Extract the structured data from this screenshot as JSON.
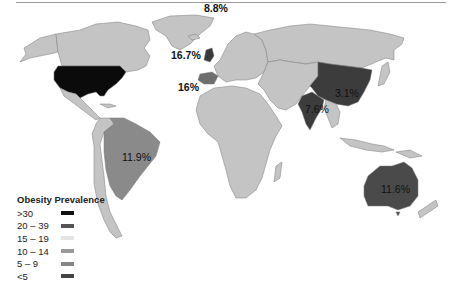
{
  "map": {
    "title": "",
    "colors": {
      "land_default": "#c4c4c4",
      "border": "#7a7a7a",
      "usa": "#0b0b0b",
      "china_india": "#3c3c3c",
      "australia": "#4a4a4a",
      "brazil": "#8a8a8a",
      "spain": "#6e6e6e",
      "uk": "#3a3a3a"
    },
    "annotations": [
      {
        "region": "Iceland/Norway",
        "text": "8.8%"
      },
      {
        "region": "United Kingdom",
        "text": "16.7%"
      },
      {
        "region": "Spain",
        "text": "16%"
      },
      {
        "region": "China",
        "text": "3.1%"
      },
      {
        "region": "India",
        "text": "7.6%"
      },
      {
        "region": "Brazil",
        "text": "11.9%"
      },
      {
        "region": "Australia",
        "text": "11.6%"
      }
    ]
  },
  "legend": {
    "title": "Obesity Prevalence",
    "items": [
      {
        "label": ">30",
        "color": "#111111"
      },
      {
        "label": "20 – 39",
        "color": "#555555"
      },
      {
        "label": "15 – 19",
        "color": "#e4e4e4"
      },
      {
        "label": "10 – 14",
        "color": "#9a9a9a"
      },
      {
        "label": "5 – 9",
        "color": "#858585"
      },
      {
        "label": "<5",
        "color": "#444444"
      }
    ]
  }
}
